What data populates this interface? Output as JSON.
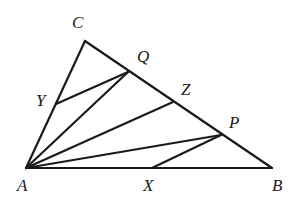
{
  "figure": {
    "kind": "geometry-diagram",
    "background_color": "#ffffff",
    "stroke_color": "#1a1a1a",
    "label_color": "#1a1a1a",
    "width": 294,
    "height": 200
  },
  "points": {
    "A": {
      "label": "A",
      "x": 26,
      "y": 168,
      "label_x": 17,
      "label_y": 177,
      "font_size": 17
    },
    "B": {
      "label": "B",
      "x": 272,
      "y": 168,
      "label_x": 272,
      "label_y": 177,
      "font_size": 17
    },
    "C": {
      "label": "C",
      "x": 85,
      "y": 41,
      "label_x": 72,
      "label_y": 14,
      "font_size": 17
    },
    "Q": {
      "label": "Q",
      "x": 128,
      "y": 72,
      "label_x": 137,
      "label_y": 48,
      "font_size": 17
    },
    "Z": {
      "label": "Z",
      "x": 173,
      "y": 102,
      "label_x": 181,
      "label_y": 81,
      "font_size": 17
    },
    "P": {
      "label": "P",
      "x": 221,
      "y": 135,
      "label_x": 229,
      "label_y": 114,
      "font_size": 17
    },
    "Y": {
      "label": "Y",
      "x": 56,
      "y": 104,
      "label_x": 36,
      "label_y": 92,
      "font_size": 17
    },
    "X": {
      "label": "X",
      "x": 152,
      "y": 168,
      "label_x": 143,
      "label_y": 177,
      "font_size": 17
    }
  },
  "segments": [
    {
      "name": "side-AB",
      "from": "A",
      "to": "B",
      "width": 2.2
    },
    {
      "name": "side-AC",
      "from": "A",
      "to": "C",
      "width": 2.2
    },
    {
      "name": "side-CB",
      "from": "C",
      "to": "B",
      "width": 2.2
    },
    {
      "name": "cevian-AQ",
      "from": "A",
      "to": "Q",
      "width": 2.2
    },
    {
      "name": "cevian-AZ",
      "from": "A",
      "to": "Z",
      "width": 2.2
    },
    {
      "name": "cevian-AP",
      "from": "A",
      "to": "P",
      "width": 2.2
    },
    {
      "name": "segment-YQ",
      "from": "Y",
      "to": "Q",
      "width": 2.2
    },
    {
      "name": "segment-XP",
      "from": "X",
      "to": "P",
      "width": 2.2
    }
  ],
  "label_order": [
    "C",
    "Q",
    "Y",
    "Z",
    "P",
    "A",
    "X",
    "B"
  ]
}
